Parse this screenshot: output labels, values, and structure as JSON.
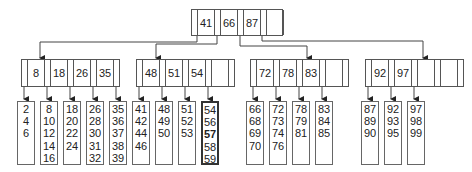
{
  "diagram": {
    "type": "b-tree",
    "root": {
      "keys": [
        "41",
        "66",
        "87",
        ""
      ]
    },
    "internal": [
      {
        "keys": [
          "8",
          "18",
          "26",
          "35"
        ]
      },
      {
        "keys": [
          "48",
          "51",
          "54",
          ""
        ]
      },
      {
        "keys": [
          "72",
          "78",
          "83",
          ""
        ]
      },
      {
        "keys": [
          "92",
          "97",
          "",
          ""
        ]
      }
    ],
    "leaves": [
      {
        "values": [
          "2",
          "4",
          "6"
        ]
      },
      {
        "values": [
          "8",
          "10",
          "12",
          "14",
          "16"
        ]
      },
      {
        "values": [
          "18",
          "20",
          "22",
          "24"
        ]
      },
      {
        "values": [
          "26",
          "28",
          "30",
          "31",
          "32"
        ]
      },
      {
        "values": [
          "35",
          "36",
          "37",
          "38",
          "39"
        ]
      },
      {
        "values": [
          "41",
          "42",
          "44",
          "46"
        ]
      },
      {
        "values": [
          "48",
          "49",
          "50"
        ]
      },
      {
        "values": [
          "51",
          "52",
          "53"
        ]
      },
      {
        "values": [
          "54",
          "56",
          "57",
          "58",
          "59"
        ],
        "highlighted": true,
        "bold_value": "57"
      },
      {
        "values": [
          "66",
          "68",
          "69",
          "70"
        ]
      },
      {
        "values": [
          "72",
          "73",
          "74",
          "76"
        ]
      },
      {
        "values": [
          "78",
          "79",
          "81"
        ]
      },
      {
        "values": [
          "83",
          "84",
          "85"
        ]
      },
      {
        "values": [
          "87",
          "89",
          "90"
        ]
      },
      {
        "values": [
          "92",
          "93",
          "95"
        ]
      },
      {
        "values": [
          "97",
          "98",
          "99"
        ]
      }
    ],
    "line_color": "#444444"
  }
}
